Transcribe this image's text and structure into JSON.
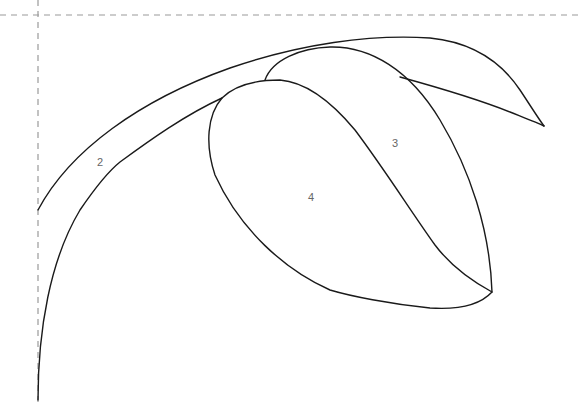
{
  "drawing": {
    "type": "coloring-page-outline",
    "subject": "flower-bud",
    "colors": {
      "outline": "#1a1a1a",
      "guide": "#9a9a9a",
      "label": "#666666",
      "background": "#ffffff"
    },
    "guides": {
      "horizontal_y": 15,
      "vertical_x": 38
    },
    "regions": [
      {
        "id": "2",
        "label": "2",
        "x": 100,
        "y": 162
      },
      {
        "id": "3",
        "label": "3",
        "x": 395,
        "y": 143
      },
      {
        "id": "4",
        "label": "4",
        "x": 311,
        "y": 197
      }
    ]
  }
}
